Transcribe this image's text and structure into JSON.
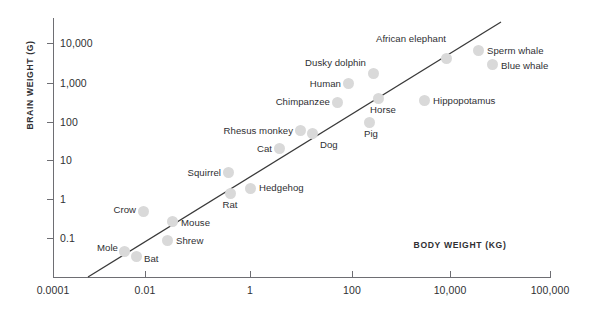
{
  "chart_data": {
    "type": "scatter",
    "title": "",
    "xlabel": "BODY WEIGHT (KG)",
    "ylabel": "BRAIN WEIGHT (G)",
    "xscale": "log",
    "yscale": "log",
    "grid": false,
    "legend": "none",
    "xticks": [
      "0.0001",
      "0.01",
      "1",
      "100",
      "10,000",
      "100,000"
    ],
    "xtick_values": [
      0.0001,
      0.01,
      1,
      100,
      10000,
      100000
    ],
    "yticks": [
      "10,000",
      "1,000",
      "100",
      "10",
      "1",
      "0.1"
    ],
    "ytick_values": [
      10000,
      1000,
      100,
      10,
      1,
      0.1
    ],
    "trendline": {
      "present": true,
      "color": "#3a3a3a"
    },
    "point_color": "#d9d9d9",
    "text_color": "#2f2f33",
    "axis_color": "#6e6e73",
    "points": [
      {
        "name": "Mole",
        "body_kg": 0.075,
        "brain_g": 1.0,
        "label_pos": "left"
      },
      {
        "name": "Bat",
        "body_kg": 0.15,
        "brain_g": 0.6,
        "label_pos": "right"
      },
      {
        "name": "Shrew",
        "body_kg": 0.9,
        "brain_g": 1.4,
        "label_pos": "right"
      },
      {
        "name": "Crow",
        "body_kg": 0.3,
        "brain_g": 9,
        "label_pos": "left"
      },
      {
        "name": "Mouse",
        "body_kg": 1.5,
        "brain_g": 4,
        "label_pos": "right"
      },
      {
        "name": "Rat",
        "body_kg": 14,
        "brain_g": 25,
        "label_pos": "above"
      },
      {
        "name": "Squirrel",
        "body_kg": 13,
        "brain_g": 110,
        "label_pos": "left"
      },
      {
        "name": "Hedgehog",
        "body_kg": 38,
        "brain_g": 45,
        "label_pos": "right"
      },
      {
        "name": "Cat",
        "body_kg": 340,
        "brain_g": 440,
        "label_pos": "left"
      },
      {
        "name": "Rhesus monkey",
        "body_kg": 1400,
        "brain_g": 2100,
        "label_pos": "left"
      },
      {
        "name": "Dog",
        "body_kg": 3200,
        "brain_g": 1700,
        "label_pos": "right"
      },
      {
        "name": "Chimpanzee",
        "body_kg": 16000,
        "brain_g": 16000,
        "label_pos": "left"
      },
      {
        "name": "Human",
        "body_kg": 38000,
        "brain_g": 75000,
        "label_pos": "left"
      },
      {
        "name": "Pig",
        "body_kg": 120000,
        "brain_g": 3000,
        "label_pos": "above"
      },
      {
        "name": "Horse",
        "body_kg": 200000,
        "brain_g": 28000,
        "label_pos": "above"
      },
      {
        "name": "Dusky dolphin",
        "body_kg": 95000,
        "brain_g": 330000,
        "label_pos": "left"
      },
      {
        "name": "African elephant",
        "body_kg": 2000000,
        "brain_g": 1000000,
        "label_pos": "above"
      },
      {
        "name": "Hippopotamus",
        "body_kg": 900000,
        "brain_g": 2800,
        "label_pos": "right"
      },
      {
        "name": "Sperm whale",
        "body_kg": 4000000,
        "brain_g": 2300000,
        "label_pos": "right"
      },
      {
        "name": "Blue whale",
        "body_kg": 7000000,
        "brain_g": 900000,
        "label_pos": "right"
      }
    ],
    "pixel_layout": {
      "note": "Rendering coordinates read off the source image",
      "plot": {
        "x0": 53,
        "y0": 18,
        "x1": 551,
        "y1": 277
      },
      "xtick_px": [
        53,
        145,
        250,
        352,
        450,
        550
      ],
      "ytick_px": [
        43,
        83,
        122,
        160,
        199,
        238
      ],
      "trendline_px": {
        "x1": 88,
        "y1": 277,
        "x2": 501,
        "y2": 22
      },
      "points_px": [
        {
          "name": "Mole",
          "x": 124,
          "y": 251,
          "lx": 118,
          "ly": 247
        },
        {
          "name": "Bat",
          "x": 136,
          "y": 256,
          "lx": 144,
          "ly": 258
        },
        {
          "name": "Shrew",
          "x": 167,
          "y": 240,
          "lx": 176,
          "ly": 240
        },
        {
          "name": "Crow",
          "x": 143,
          "y": 211,
          "lx": 136,
          "ly": 209
        },
        {
          "name": "Mouse",
          "x": 172,
          "y": 221,
          "lx": 181,
          "ly": 222
        },
        {
          "name": "Rat",
          "x": 230,
          "y": 193,
          "lx": 230,
          "ly": 210
        },
        {
          "name": "Squirrel",
          "x": 228,
          "y": 172,
          "lx": 221,
          "ly": 172
        },
        {
          "name": "Hedgehog",
          "x": 250,
          "y": 188,
          "lx": 259,
          "ly": 187
        },
        {
          "name": "Cat",
          "x": 279,
          "y": 148,
          "lx": 272,
          "ly": 148
        },
        {
          "name": "Rhesus monkey",
          "x": 300,
          "y": 130,
          "lx": 293,
          "ly": 130
        },
        {
          "name": "Dog",
          "x": 312,
          "y": 133,
          "lx": 320,
          "ly": 144
        },
        {
          "name": "Chimpanzee",
          "x": 337,
          "y": 102,
          "lx": 330,
          "ly": 101
        },
        {
          "name": "Human",
          "x": 348,
          "y": 83,
          "lx": 341,
          "ly": 83
        },
        {
          "name": "Pig",
          "x": 369,
          "y": 122,
          "lx": 371,
          "ly": 139
        },
        {
          "name": "Horse",
          "x": 378,
          "y": 98,
          "lx": 383,
          "ly": 115
        },
        {
          "name": "Dusky dolphin",
          "x": 373,
          "y": 73,
          "lx": 366,
          "ly": 62
        },
        {
          "name": "African elephant",
          "x": 446,
          "y": 58,
          "lx": 411,
          "ly": 44
        },
        {
          "name": "Hippopotamus",
          "x": 424,
          "y": 100,
          "lx": 433,
          "ly": 100
        },
        {
          "name": "Sperm whale",
          "x": 478,
          "y": 50,
          "lx": 487,
          "ly": 50
        },
        {
          "name": "Blue whale",
          "x": 492,
          "y": 64,
          "lx": 501,
          "ly": 65
        }
      ]
    }
  }
}
